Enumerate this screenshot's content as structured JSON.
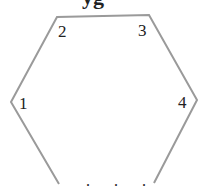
{
  "diagram": {
    "shape": "hexagon (open at bottom)",
    "stroke_color": "#9a9a9a",
    "labels": [
      {
        "id": "v1",
        "text": "1"
      },
      {
        "id": "v2",
        "text": "2"
      },
      {
        "id": "v3",
        "text": "3"
      },
      {
        "id": "v4",
        "text": "4"
      }
    ],
    "ellipsis": ". . .",
    "top_cut_text": "yg"
  }
}
